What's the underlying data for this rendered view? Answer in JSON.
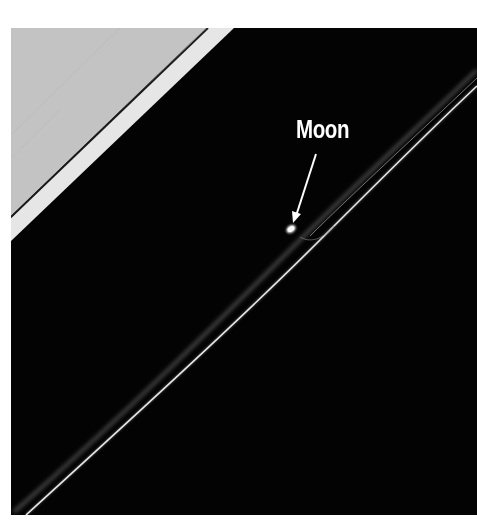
{
  "image": {
    "subject": "Saturn ring with embedded moon (image by spacecraft)",
    "colors": {
      "background": "#ffffff",
      "planet_gray": "#c3c3c3",
      "ring_band": "#e6e6e6",
      "dark_line": "#1a1a1a",
      "space": "#030303",
      "ring_strand": "#d8d8d8",
      "annotation": "#ffffff"
    }
  },
  "annotation": {
    "label": "Moon",
    "arrow": {
      "from": [
        316,
        154
      ],
      "to": [
        295,
        222
      ]
    },
    "moon_position": [
      291,
      229
    ]
  }
}
